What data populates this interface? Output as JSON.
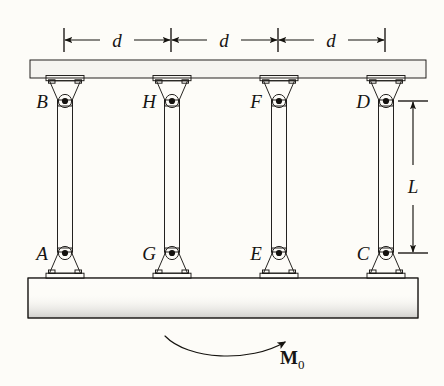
{
  "figure": {
    "background_color": "#fdfcf8",
    "ink_color": "#15130f"
  },
  "dimensions": {
    "horizontal": [
      {
        "id": "d1",
        "label": "d"
      },
      {
        "id": "d2",
        "label": "d"
      },
      {
        "id": "d3",
        "label": "d"
      }
    ],
    "vertical": [
      {
        "id": "L",
        "label": "L"
      }
    ]
  },
  "joints": {
    "top": [
      {
        "id": "B",
        "label": "B"
      },
      {
        "id": "H",
        "label": "H"
      },
      {
        "id": "F",
        "label": "F"
      },
      {
        "id": "D",
        "label": "D"
      }
    ],
    "bottom": [
      {
        "id": "A",
        "label": "A"
      },
      {
        "id": "G",
        "label": "G"
      },
      {
        "id": "E",
        "label": "E"
      },
      {
        "id": "C",
        "label": "C"
      }
    ]
  },
  "load": {
    "symbol": "M",
    "subscript": "0",
    "direction": "counterclockwise-arrow-to-right"
  },
  "slabs": {
    "top": {
      "name": "top-rigid-slab",
      "fill": "#a8a49d"
    },
    "bottom": {
      "name": "bottom-rigid-slab",
      "fill": "#6e6a63"
    }
  },
  "columns": {
    "count": 4,
    "fill_dark": "#4e4a44",
    "fill_light": "#d2cec7"
  }
}
